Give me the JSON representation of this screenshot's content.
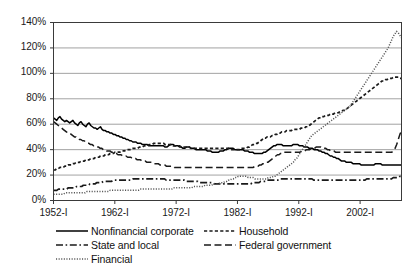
{
  "chart_data": {
    "type": "line",
    "title": "",
    "xlabel": "",
    "ylabel": "",
    "grid": true,
    "legend_position": "bottom",
    "ylim": [
      0,
      140
    ],
    "ytick_labels": [
      "0%",
      "20%",
      "40%",
      "60%",
      "80%",
      "100%",
      "120%",
      "140%"
    ],
    "ytick_values": [
      0,
      20,
      40,
      60,
      80,
      100,
      120,
      140
    ],
    "xtick_labels": [
      "1952-I",
      "1962-I",
      "1972-I",
      "1982-I",
      "1992-I",
      "2002-I"
    ],
    "xtick_values": [
      1952,
      1962,
      1972,
      1982,
      1992,
      2002
    ],
    "xlim": [
      1952,
      2008.75
    ],
    "x_step_years": 0.25,
    "series": [
      {
        "name": "Nonfinancial corporate",
        "style": "solid",
        "color": "#000000",
        "values": [
          65,
          64,
          63,
          65,
          66,
          64,
          63,
          62,
          63,
          62,
          61,
          62,
          63,
          61,
          60,
          59,
          61,
          62,
          60,
          59,
          58,
          60,
          61,
          59,
          58,
          57,
          57,
          56,
          57,
          58,
          56,
          55,
          55,
          54,
          54,
          53,
          53,
          52,
          52,
          51,
          51,
          50,
          50,
          49,
          49,
          48,
          48,
          47,
          47,
          46,
          46,
          46,
          45,
          45,
          45,
          44,
          44,
          44,
          44,
          43,
          43,
          43,
          43,
          43,
          43,
          43,
          43,
          43,
          43,
          42,
          42,
          43,
          44,
          44,
          44,
          43,
          43,
          43,
          42,
          42,
          41,
          41,
          42,
          42,
          42,
          41,
          41,
          41,
          40,
          40,
          40,
          40,
          40,
          40,
          40,
          39,
          39,
          39,
          38,
          38,
          38,
          38,
          38,
          39,
          39,
          39,
          40,
          40,
          41,
          41,
          41,
          41,
          40,
          40,
          40,
          40,
          40,
          40,
          39,
          39,
          39,
          38,
          38,
          38,
          37,
          37,
          37,
          37,
          37,
          37,
          38,
          38,
          39,
          40,
          41,
          42,
          43,
          43,
          44,
          44,
          44,
          44,
          43,
          43,
          43,
          43,
          43,
          43,
          44,
          44,
          44,
          44,
          43,
          43,
          43,
          42,
          42,
          42,
          41,
          41,
          41,
          40,
          40,
          40,
          39,
          39,
          38,
          38,
          37,
          37,
          36,
          35,
          35,
          34,
          34,
          33,
          33,
          32,
          31,
          31,
          31,
          30,
          30,
          30,
          30,
          29,
          29,
          29,
          29,
          29,
          28,
          28,
          28,
          28,
          28,
          28,
          28,
          28,
          28,
          29,
          29,
          29,
          29,
          28,
          28,
          28,
          28,
          28,
          28,
          28,
          28,
          28,
          28,
          28,
          28,
          28
        ]
      },
      {
        "name": "Household",
        "style": "dashed-short",
        "color": "#1a1a1a",
        "values": [
          24,
          24,
          25,
          25,
          26,
          26,
          26,
          27,
          27,
          28,
          28,
          28,
          29,
          29,
          30,
          30,
          30,
          31,
          31,
          31,
          32,
          32,
          32,
          33,
          33,
          33,
          34,
          34,
          34,
          35,
          35,
          35,
          36,
          36,
          36,
          37,
          37,
          37,
          38,
          38,
          38,
          38,
          39,
          39,
          39,
          40,
          40,
          40,
          40,
          41,
          41,
          41,
          41,
          42,
          42,
          42,
          43,
          43,
          43,
          44,
          44,
          44,
          45,
          45,
          45,
          45,
          45,
          45,
          45,
          44,
          44,
          44,
          44,
          44,
          43,
          43,
          43,
          43,
          43,
          42,
          42,
          42,
          42,
          42,
          42,
          41,
          41,
          41,
          41,
          41,
          41,
          41,
          41,
          41,
          41,
          41,
          41,
          41,
          41,
          41,
          41,
          41,
          41,
          41,
          41,
          41,
          41,
          41,
          41,
          40,
          40,
          40,
          40,
          40,
          40,
          40,
          41,
          41,
          41,
          41,
          42,
          42,
          43,
          44,
          44,
          45,
          45,
          46,
          47,
          48,
          49,
          49,
          50,
          50,
          50,
          51,
          51,
          52,
          52,
          53,
          53,
          54,
          54,
          54,
          55,
          55,
          55,
          55,
          56,
          56,
          56,
          56,
          56,
          57,
          57,
          57,
          58,
          58,
          59,
          60,
          61,
          62,
          63,
          64,
          65,
          65,
          66,
          66,
          67,
          67,
          67,
          68,
          68,
          68,
          69,
          69,
          69,
          70,
          70,
          71,
          71,
          72,
          73,
          74,
          75,
          76,
          77,
          78,
          79,
          80,
          81,
          82,
          83,
          84,
          85,
          86,
          87,
          88,
          89,
          90,
          91,
          92,
          93,
          94,
          94,
          95,
          95,
          96,
          96,
          96,
          97,
          97,
          97,
          97,
          96,
          96
        ]
      },
      {
        "name": "State and local",
        "style": "dash-dot",
        "color": "#1a1a1a",
        "values": [
          8,
          8,
          8,
          9,
          9,
          9,
          9,
          9,
          9,
          10,
          10,
          10,
          10,
          10,
          11,
          11,
          11,
          11,
          12,
          12,
          12,
          12,
          13,
          13,
          13,
          13,
          14,
          14,
          14,
          14,
          15,
          15,
          15,
          15,
          15,
          15,
          16,
          16,
          16,
          16,
          16,
          16,
          16,
          16,
          16,
          16,
          16,
          16,
          17,
          17,
          17,
          17,
          17,
          17,
          17,
          17,
          17,
          17,
          17,
          17,
          17,
          17,
          17,
          17,
          17,
          17,
          17,
          17,
          16,
          16,
          16,
          16,
          16,
          16,
          16,
          16,
          16,
          16,
          16,
          16,
          15,
          15,
          15,
          15,
          15,
          15,
          15,
          15,
          14,
          14,
          14,
          14,
          14,
          14,
          14,
          14,
          14,
          13,
          13,
          13,
          13,
          13,
          13,
          13,
          13,
          13,
          13,
          13,
          13,
          13,
          13,
          13,
          13,
          13,
          13,
          13,
          13,
          13,
          13,
          13,
          14,
          14,
          14,
          14,
          14,
          15,
          15,
          15,
          15,
          16,
          16,
          16,
          16,
          16,
          16,
          16,
          16,
          17,
          17,
          17,
          17,
          17,
          17,
          17,
          17,
          17,
          17,
          17,
          17,
          17,
          17,
          17,
          17,
          17,
          17,
          17,
          17,
          16,
          16,
          16,
          16,
          16,
          16,
          16,
          16,
          16,
          16,
          16,
          16,
          16,
          16,
          16,
          16,
          16,
          16,
          16,
          16,
          16,
          16,
          16,
          16,
          16,
          16,
          16,
          16,
          16,
          16,
          16,
          16,
          17,
          17,
          17,
          17,
          17,
          17,
          17,
          17,
          17,
          17,
          17,
          17,
          17,
          17,
          17,
          17,
          18,
          18,
          18,
          18,
          19,
          19
        ]
      },
      {
        "name": "Federal government",
        "style": "dashed-long",
        "color": "#1a1a1a",
        "values": [
          62,
          61,
          60,
          59,
          58,
          57,
          56,
          55,
          54,
          53,
          53,
          52,
          51,
          50,
          50,
          49,
          48,
          48,
          47,
          47,
          46,
          45,
          45,
          44,
          44,
          43,
          43,
          42,
          42,
          41,
          41,
          40,
          40,
          39,
          39,
          39,
          38,
          38,
          37,
          37,
          36,
          36,
          36,
          35,
          35,
          35,
          34,
          34,
          34,
          33,
          33,
          33,
          32,
          32,
          32,
          31,
          31,
          31,
          30,
          30,
          30,
          30,
          29,
          29,
          29,
          29,
          28,
          28,
          28,
          28,
          27,
          27,
          27,
          27,
          27,
          26,
          26,
          26,
          26,
          26,
          26,
          26,
          26,
          26,
          26,
          26,
          26,
          26,
          26,
          26,
          26,
          26,
          26,
          26,
          26,
          26,
          26,
          26,
          26,
          26,
          26,
          26,
          26,
          26,
          26,
          26,
          26,
          26,
          26,
          26,
          26,
          26,
          26,
          26,
          26,
          26,
          26,
          26,
          26,
          26,
          26,
          26,
          26,
          26,
          26,
          27,
          27,
          27,
          28,
          28,
          29,
          29,
          30,
          30,
          31,
          32,
          33,
          34,
          35,
          36,
          36,
          37,
          37,
          38,
          38,
          38,
          38,
          38,
          38,
          38,
          38,
          38,
          38,
          38,
          39,
          39,
          39,
          40,
          40,
          40,
          41,
          41,
          41,
          42,
          42,
          42,
          42,
          41,
          41,
          41,
          40,
          40,
          39,
          39,
          39,
          38,
          38,
          38,
          38,
          38,
          38,
          38,
          38,
          38,
          38,
          38,
          38,
          38,
          38,
          38,
          38,
          38,
          38,
          38,
          38,
          38,
          38,
          38,
          38,
          38,
          38,
          38,
          38,
          38,
          38,
          38,
          38,
          38,
          38,
          38,
          38,
          39,
          41,
          44,
          48,
          52,
          55
        ]
      },
      {
        "name": "Financial",
        "style": "dotted",
        "color": "#555555",
        "values": [
          5,
          5,
          5,
          5,
          5,
          5,
          5,
          6,
          6,
          6,
          6,
          6,
          6,
          6,
          6,
          6,
          6,
          6,
          6,
          6,
          7,
          7,
          7,
          7,
          7,
          7,
          7,
          7,
          7,
          7,
          7,
          7,
          7,
          7,
          8,
          8,
          8,
          8,
          8,
          8,
          8,
          8,
          8,
          8,
          8,
          8,
          8,
          8,
          8,
          8,
          8,
          8,
          9,
          9,
          9,
          9,
          9,
          9,
          9,
          9,
          9,
          9,
          9,
          9,
          9,
          9,
          9,
          9,
          9,
          9,
          9,
          9,
          10,
          10,
          10,
          10,
          10,
          10,
          10,
          10,
          10,
          10,
          10,
          10,
          11,
          11,
          11,
          11,
          11,
          11,
          11,
          12,
          12,
          12,
          12,
          12,
          13,
          13,
          13,
          13,
          14,
          14,
          14,
          15,
          15,
          16,
          16,
          17,
          17,
          18,
          18,
          19,
          19,
          19,
          19,
          19,
          19,
          18,
          18,
          18,
          18,
          17,
          17,
          17,
          17,
          17,
          17,
          17,
          17,
          18,
          18,
          18,
          19,
          19,
          20,
          21,
          22,
          23,
          24,
          25,
          26,
          27,
          28,
          29,
          30,
          32,
          33,
          35,
          37,
          39,
          41,
          43,
          45,
          47,
          49,
          51,
          52,
          53,
          54,
          55,
          56,
          57,
          58,
          59,
          60,
          61,
          62,
          63,
          64,
          65,
          66,
          67,
          68,
          69,
          70,
          71,
          72,
          73,
          74,
          76,
          78,
          80,
          82,
          84,
          86,
          88,
          90,
          92,
          94,
          96,
          98,
          100,
          102,
          104,
          106,
          108,
          110,
          112,
          114,
          116,
          118,
          120,
          123,
          126,
          129,
          131,
          133,
          132,
          130,
          128
        ]
      }
    ]
  }
}
